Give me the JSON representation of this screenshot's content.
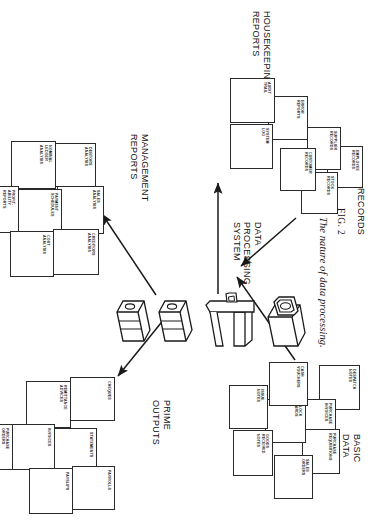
{
  "figure": {
    "caption_number": "FIG. 2",
    "caption_text": "The nature of data processing.",
    "center_label": "DATA\nPROCESSING\nSYSTEM"
  },
  "groups": {
    "basic_data": {
      "title": "BASIC DATA",
      "items": [
        {
          "label": "PURCHASE\nINVOICES"
        },
        {
          "label": "PURCHASE\nREQUISITIONS"
        },
        {
          "label": "DESPATCH\nNOTES"
        },
        {
          "label": "SALES\nORDERS"
        },
        {
          "label": "CLOCK\nCARDS"
        },
        {
          "label": "CASH\nVOUCHERS"
        },
        {
          "label": "GOODS\nRECEIVED\nNOTES"
        },
        {
          "label": "ISSUE\nNOTES"
        }
      ]
    },
    "records": {
      "title": "RECORDS",
      "items": [
        {
          "label": "EMPLOYEE\nRECORDS"
        },
        {
          "label": "SUPPLIER\nRECORDS"
        },
        {
          "label": "STOCK\nRECORDS"
        },
        {
          "label": "CUSTOMER\nRECORDS"
        }
      ]
    },
    "housekeeping_reports": {
      "title": "HOUSEKEEPING\nREPORTS",
      "items": [
        {
          "label": "ERROR\nREPORTS"
        },
        {
          "label": "AUDIT\nTRAIL"
        },
        {
          "label": "SYSTEM\nLOG"
        }
      ]
    },
    "management_reports": {
      "title": "MANAGEMENT\nREPORTS",
      "items": [
        {
          "label": "DEBTORS\nANALYSIS"
        },
        {
          "label": "NOMINAL\nLEDGER\nANALYSIS"
        },
        {
          "label": "SALES\nANALYSIS"
        },
        {
          "label": "PAYMENT\nSCHEDULES"
        },
        {
          "label": "PROFIT-\nABILITY\nREPORTS"
        },
        {
          "label": "CREDITORS\nANALYSIS"
        },
        {
          "label": "COST\nANALYSIS"
        }
      ]
    },
    "prime_outputs": {
      "title": "PRIME OUTPUTS",
      "items": [
        {
          "label": "CHEQUES"
        },
        {
          "label": "STATEMENTS"
        },
        {
          "label": "REMITTANCE\nADVICES"
        },
        {
          "label": "INVOICES"
        },
        {
          "label": "PAYSLIPS"
        },
        {
          "label": "PAYROLLS"
        },
        {
          "label": "PURCHASE\nORDERS"
        }
      ]
    }
  },
  "equipment": {
    "items": [
      {
        "name": "printer-device"
      },
      {
        "name": "computer-console-device"
      },
      {
        "name": "tape-drive-upper"
      },
      {
        "name": "tape-drive-lower"
      }
    ]
  },
  "style": {
    "line_color": "#2a2a2a",
    "text_color": "#111111",
    "background": "#ffffff"
  }
}
